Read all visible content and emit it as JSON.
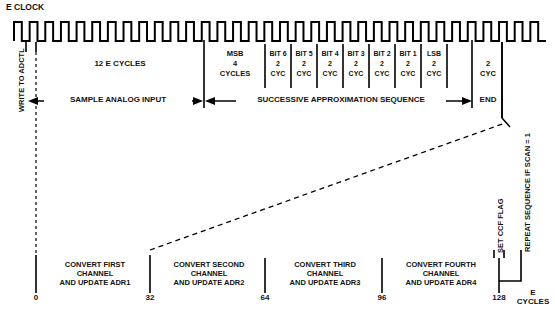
{
  "diagram": {
    "title_label": "E CLOCK",
    "clock": {
      "cycles_drawn": 34,
      "description": "square-wave-e-clock"
    },
    "left_marker": {
      "label": "WRITE TO ADCTL"
    },
    "phases": [
      {
        "name": "sample",
        "label": "12 E CYCLES",
        "arrow_label": "SAMPLE ANALOG INPUT"
      },
      {
        "name": "approximation",
        "arrow_label": "SUCCESSIVE APPROXIMATION SEQUENCE"
      },
      {
        "name": "end",
        "label": "END"
      }
    ],
    "bit_columns": [
      {
        "name": "msb",
        "line1": "MSB",
        "line2": "4",
        "line3": "CYCLES"
      },
      {
        "name": "bit6",
        "line1": "BIT 6",
        "line2": "2",
        "line3": "CYC"
      },
      {
        "name": "bit5",
        "line1": "BIT 5",
        "line2": "2",
        "line3": "CYC"
      },
      {
        "name": "bit4",
        "line1": "BIT 4",
        "line2": "2",
        "line3": "CYC"
      },
      {
        "name": "bit3",
        "line1": "BIT 3",
        "line2": "2",
        "line3": "CYC"
      },
      {
        "name": "bit2",
        "line1": "BIT 2",
        "line2": "2",
        "line3": "CYC"
      },
      {
        "name": "bit1",
        "line1": "BIT 1",
        "line2": "2",
        "line3": "CYC"
      },
      {
        "name": "lsb",
        "line1": "LSB",
        "line2": "2",
        "line3": "CYC"
      },
      {
        "name": "end",
        "line1": "",
        "line2": "2",
        "line3": "CYC"
      }
    ],
    "right_labels": {
      "set_ccf_flag": "SET CCF FLAG",
      "repeat_sequence": "REPEAT SEQUENCE IF SCAN = 1"
    },
    "conversions": [
      {
        "name": "first",
        "line1": "CONVERT FIRST",
        "line2": "CHANNEL",
        "line3": "AND UPDATE ADR1"
      },
      {
        "name": "second",
        "line1": "CONVERT SECOND",
        "line2": "CHANNEL",
        "line3": "AND UPDATE ADR2"
      },
      {
        "name": "third",
        "line1": "CONVERT THIRD",
        "line2": "CHANNEL",
        "line3": "AND UPDATE ADR3"
      },
      {
        "name": "fourth",
        "line1": "CONVERT FOURTH",
        "line2": "CHANNEL",
        "line3": "AND UPDATE ADR4"
      }
    ],
    "axis": {
      "ticks": [
        "0",
        "32",
        "64",
        "96",
        "128"
      ],
      "unit_line1": "E",
      "unit_line2": "CYCLES"
    },
    "colors": {
      "stroke": "#000000",
      "background": "#ffffff"
    }
  },
  "chart_data": {
    "type": "line",
    "title": "E CLOCK",
    "xlabel": "E CYCLES",
    "ylabel": "",
    "x": [
      0,
      32,
      64,
      96,
      128
    ],
    "categories": [
      "0",
      "32",
      "64",
      "96",
      "128"
    ],
    "series": [
      {
        "name": "E CLOCK",
        "values": [
          1,
          0,
          1,
          0,
          1
        ]
      }
    ],
    "annotations": [
      "12 E CYCLES",
      "SAMPLE ANALOG INPUT",
      "SUCCESSIVE APPROXIMATION SEQUENCE",
      "END",
      "WRITE TO ADCTL",
      "SET CCF FLAG",
      "REPEAT SEQUENCE IF SCAN = 1"
    ],
    "xlim": [
      0,
      128
    ],
    "grid": false,
    "legend": "none"
  }
}
